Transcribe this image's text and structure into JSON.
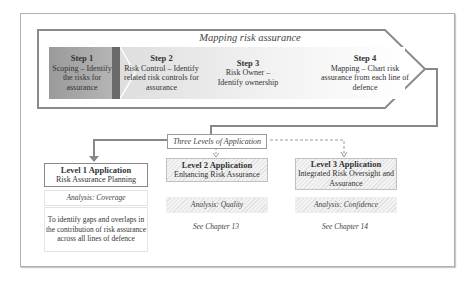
{
  "diagram": {
    "title": "Mapping risk assurance",
    "steps": [
      {
        "label": "Step 1",
        "text": "Scoping – Identify the risks for assurance"
      },
      {
        "label": "Step 2",
        "text": "Risk Control – Identify related risk controls for assurance"
      },
      {
        "label": "Step  3",
        "text": "Risk Owner – Identify ownership"
      },
      {
        "label": "Step  4",
        "text": "Mapping – Chart risk assurance from each line of defence"
      }
    ],
    "connector_label": "Three Levels of Application",
    "levels": [
      {
        "title": "Level 1 Application",
        "subtitle": "Risk Assurance Planning",
        "analysis": "Analysis: Coverage",
        "description": "To identify gaps and overlaps in the contribution of risk assurance across all lines of defence"
      },
      {
        "title": "Level 2 Application",
        "subtitle": "Enhancing Risk Assurance",
        "analysis": "Analysis: Quality",
        "reference": "See Chapter 13"
      },
      {
        "title": "Level 3 Application",
        "subtitle": "Integrated Risk Oversight and Assurance",
        "analysis": "Analysis: Confidence",
        "reference": "See Chapter 14"
      }
    ],
    "colors": {
      "frame": "#b0b0b0",
      "arrow_outline": "#8a8a8a",
      "step1_fill": "#a8a8a8",
      "step1_bar": "#6a6a6a",
      "hatch": "#e2e2e2"
    }
  }
}
